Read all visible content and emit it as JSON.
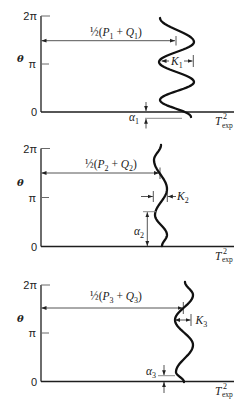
{
  "figure": {
    "panels": [
      {
        "y_axis_label": "θ",
        "y_ticks": {
          "zero": "0",
          "pi": "π",
          "two_pi": "2π"
        },
        "x_axis_label": {
          "main": "T",
          "sup": "2",
          "sub": "exp"
        },
        "mean_label": {
          "half": "½",
          "open": "(",
          "p": "P",
          "p_sub": "1",
          "plus": " + ",
          "q": "Q",
          "q_sub": "1",
          "close": ")"
        },
        "amplitude_label": {
          "main": "K",
          "sub": "1"
        },
        "phase_label": {
          "main": "α",
          "sub": "1"
        }
      },
      {
        "y_axis_label": "θ",
        "y_ticks": {
          "zero": "0",
          "pi": "π",
          "two_pi": "2π"
        },
        "x_axis_label": {
          "main": "T",
          "sup": "2",
          "sub": "exp"
        },
        "mean_label": {
          "half": "½",
          "open": "(",
          "p": "P",
          "p_sub": "2",
          "plus": " + ",
          "q": "Q",
          "q_sub": "2",
          "close": ")"
        },
        "amplitude_label": {
          "main": "K",
          "sub": "2"
        },
        "phase_label": {
          "main": "α",
          "sub": "2"
        }
      },
      {
        "y_axis_label": "θ",
        "y_ticks": {
          "zero": "0",
          "pi": "π",
          "two_pi": "2π"
        },
        "x_axis_label": {
          "main": "T",
          "sup": "2",
          "sub": "exp"
        },
        "mean_label": {
          "half": "½",
          "open": "(",
          "p": "P",
          "p_sub": "3",
          "plus": " + ",
          "q": "Q",
          "q_sub": "3",
          "close": ")"
        },
        "amplitude_label": {
          "main": "K",
          "sub": "3"
        },
        "phase_label": {
          "main": "α",
          "sub": "3"
        }
      }
    ]
  },
  "chart_data": [
    {
      "type": "line",
      "title": "",
      "xlabel": "T_exp^2",
      "ylabel": "θ",
      "yticks": [
        "0",
        "π",
        "2π"
      ],
      "ylim": [
        "0",
        "2π"
      ],
      "grid": false,
      "annotations": [
        "½(P₁ + Q₁)",
        "K₁",
        "α₁"
      ],
      "series": [
        {
          "name": "T_exp^2 vs θ (schematic sinusoid, panel 1)",
          "points_px": [
            [
              191,
              117
            ],
            [
              160,
              100
            ],
            [
              194,
              82
            ],
            [
              159,
              62
            ],
            [
              194,
              42
            ],
            [
              160,
              18
            ]
          ]
        }
      ]
    },
    {
      "type": "line",
      "title": "",
      "xlabel": "T_exp^2",
      "ylabel": "θ",
      "yticks": [
        "0",
        "π",
        "2π"
      ],
      "ylim": [
        "0",
        "2π"
      ],
      "grid": false,
      "annotations": [
        "½(P₂ + Q₂)",
        "K₂",
        "α₂"
      ],
      "series": [
        {
          "name": "T_exp^2 vs θ (schematic sinusoid, panel 2)",
          "points_px": [
            [
              162,
              246
            ],
            [
              167,
              235
            ],
            [
              155,
              215
            ],
            [
              167,
              189
            ],
            [
              154,
              160
            ],
            [
              161,
              145
            ]
          ]
        }
      ]
    },
    {
      "type": "line",
      "title": "",
      "xlabel": "T_exp^2",
      "ylabel": "θ",
      "yticks": [
        "0",
        "π",
        "2π"
      ],
      "ylim": [
        "0",
        "2π"
      ],
      "grid": false,
      "annotations": [
        "½(P₃ + Q₃)",
        "K₃",
        "α₃"
      ],
      "series": [
        {
          "name": "T_exp^2 vs θ (schematic sinusoid, panel 3)",
          "points_px": [
            [
              184,
              382
            ],
            [
              176,
              372
            ],
            [
              193,
              345
            ],
            [
              175,
              320
            ],
            [
              193,
              295
            ],
            [
              185,
              282
            ]
          ]
        }
      ]
    }
  ]
}
